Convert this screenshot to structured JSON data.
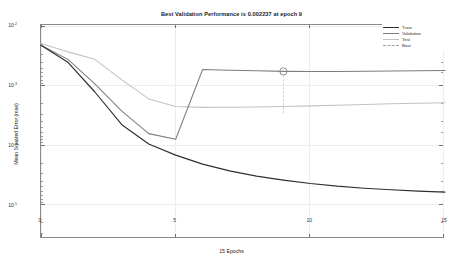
{
  "figure": {
    "title": "Best Validation Performance is 0.002237 at epoch 9",
    "xlabel": "15 Epochs",
    "ylabel": "Mean Squared Error  (mse)"
  },
  "legend": {
    "items": [
      {
        "label": "Train",
        "color": "#2f2f2f",
        "style": "solid"
      },
      {
        "label": "Validation",
        "color": "#7d7d7d",
        "style": "solid"
      },
      {
        "label": "Test",
        "color": "#c2c2c2",
        "style": "solid"
      },
      {
        "label": "Best",
        "color": "#9e9e9e",
        "style": "dashed"
      }
    ]
  },
  "axis": {
    "xticklabels": [
      "0",
      "5",
      "10",
      "15"
    ],
    "yticklabels": [
      "10",
      "10",
      "10",
      "10"
    ],
    "yticksups": [
      "-2",
      "-3",
      "-4",
      "-5"
    ]
  },
  "chart_data": {
    "type": "line",
    "title": "Best Validation Performance is 0.002237 at epoch 9",
    "xlabel": "15 Epochs",
    "ylabel": "Mean Squared Error  (mse)",
    "xlim": [
      0,
      15
    ],
    "ylim": [
      1e-05,
      0.01
    ],
    "yscale": "log",
    "xticks": [
      0,
      5,
      10,
      15
    ],
    "yticks": [
      0.01,
      0.001,
      0.0001,
      1e-05
    ],
    "grid": true,
    "legend_position": "top-right",
    "x": [
      0,
      1,
      2,
      3,
      4,
      5,
      6,
      7,
      8,
      9,
      10,
      11,
      12,
      13,
      14,
      15
    ],
    "series": [
      {
        "name": "Train",
        "color": "#2f2f2f",
        "values": [
          0.0052,
          0.003,
          0.00115,
          0.0004,
          0.000215,
          0.00015,
          0.000112,
          9e-05,
          7.6e-05,
          6.7e-05,
          6e-05,
          5.5e-05,
          5.15e-05,
          4.9e-05,
          4.7e-05,
          4.55e-05
        ]
      },
      {
        "name": "Validation",
        "color": "#7d7d7d",
        "values": [
          0.0052,
          0.0033,
          0.0015,
          0.00062,
          0.0003,
          0.00025,
          0.00238,
          0.00232,
          0.00228,
          0.002237,
          0.00223,
          0.002235,
          0.00225,
          0.00227,
          0.00229,
          0.0023
        ]
      },
      {
        "name": "Test",
        "color": "#c2c2c2",
        "values": [
          0.0055,
          0.0042,
          0.0033,
          0.0017,
          0.00092,
          0.00072,
          0.0007,
          0.000702,
          0.00071,
          0.000722,
          0.000735,
          0.00075,
          0.000768,
          0.000785,
          0.0008,
          0.000815
        ]
      }
    ],
    "best_marker": {
      "label": "Best",
      "epoch": 9,
      "value": 0.002237,
      "shape": "circle",
      "color": "#8f8f8f"
    }
  }
}
